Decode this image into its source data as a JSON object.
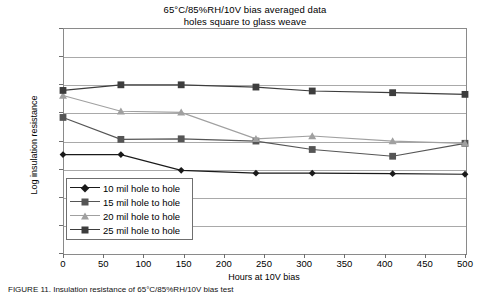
{
  "chart_data": {
    "type": "line",
    "title": "65°C/85%RH/10V bias averaged data",
    "subtitle": "holes square to glass weave",
    "xlabel": "Hours at 10V bias",
    "ylabel": "Log insulation resistance",
    "xlim": [
      0,
      500
    ],
    "ylim": [
      8,
      12
    ],
    "xticks": [
      0,
      50,
      100,
      150,
      200,
      250,
      300,
      350,
      400,
      450,
      500
    ],
    "yticks": [
      8,
      8.5,
      9,
      9.5,
      10,
      10.5,
      11,
      11.5,
      12
    ],
    "ytick_labels": [
      "8",
      "8.5",
      "9",
      "9.5",
      "10",
      "10.5",
      "11",
      "11.5",
      "12"
    ],
    "xtick_labels": [
      "0",
      "50",
      "100",
      "150",
      "200",
      "250",
      "300",
      "350",
      "400",
      "450",
      "500"
    ],
    "grid": "horizontal",
    "legend_position": "inside-lower-left",
    "x": [
      0,
      72,
      147,
      240,
      310,
      410,
      500
    ],
    "series": [
      {
        "name": "10 mil hole to hole",
        "marker": "diamond",
        "color": "#1a1a1a",
        "values": [
          9.75,
          9.75,
          9.47,
          9.42,
          9.42,
          9.41,
          9.4
        ]
      },
      {
        "name": "15 mil hole to hole",
        "marker": "square",
        "color": "#555555",
        "values": [
          10.41,
          10.02,
          10.03,
          9.99,
          9.84,
          9.72,
          9.95
        ]
      },
      {
        "name": "20 mil hole to hole",
        "marker": "triangle",
        "color": "#a0a0a0",
        "values": [
          10.8,
          10.52,
          10.5,
          10.03,
          10.08,
          9.99,
          9.95
        ]
      },
      {
        "name": "25 mil hole to hole",
        "marker": "square",
        "color": "#3d3d3d",
        "values": [
          10.89,
          10.99,
          10.99,
          10.95,
          10.88,
          10.85,
          10.82
        ]
      }
    ]
  },
  "legend": {
    "items": [
      "10 mil hole to hole",
      "15 mil hole to hole",
      "20 mil hole to hole",
      "25 mil hole to hole"
    ]
  },
  "caption": {
    "text": "FIGURE 11.  Insulation resistance of 65°C/85%RH/10V bias test"
  }
}
